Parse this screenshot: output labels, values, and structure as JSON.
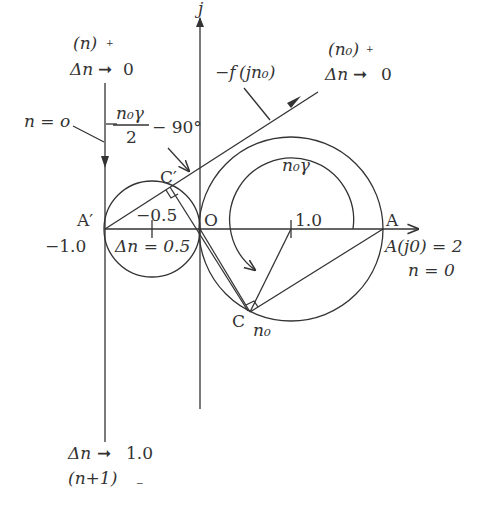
{
  "diagram": {
    "axis_labels": {
      "imag_axis": "j",
      "origin": "O"
    },
    "points": {
      "A": "A",
      "A_prime": "A′",
      "C": "C",
      "C_prime": "C′"
    },
    "labels": {
      "top_left_state": "(n)",
      "top_left_sign": "+",
      "top_left_delta": "Δn",
      "top_left_limit": "0",
      "n_equals_o": "n = o",
      "angle_numerator": "n₀γ",
      "angle_denominator": "2",
      "angle_offset": "− 90°",
      "neg_f_prefix": "−f",
      "neg_f_arg": "(jn₀)",
      "top_right_state": "(n₀)",
      "top_right_sign": "+",
      "top_right_delta": "Δn",
      "top_right_limit": "0",
      "angle_n0gamma": "n₀γ",
      "tick_neg_half": "−0.5",
      "delta_half": "Δn = 0.5",
      "neg_one": "−1.0",
      "one": "1.0",
      "A_j0": "A(j0) = 2",
      "n_zero": "n = 0",
      "n0_at_C": "n₀",
      "bottom_delta": "Δn",
      "bottom_limit": "1.0",
      "bottom_state": "(n+1)",
      "bottom_sign": "−"
    },
    "geometry": {
      "origin_O": [
        200,
        229
      ],
      "point_A": [
        383,
        229
      ],
      "point_A_prime": [
        105,
        229
      ],
      "big_circle": {
        "cx": 291,
        "cy": 229,
        "r": 92
      },
      "small_circle": {
        "cx": 152,
        "cy": 229,
        "r": 48
      },
      "inner_arc_r": 64
    }
  }
}
